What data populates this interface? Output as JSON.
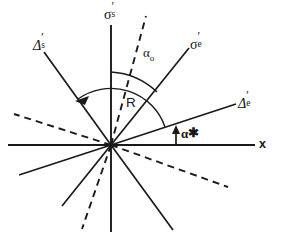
{
  "figure": {
    "type": "vector-diagram",
    "background_color": "#ffffff",
    "line_color": "#1a1a1a"
  },
  "labels": {
    "sigma_s": {
      "symbol": "σ",
      "prime": "′",
      "subscript": "s",
      "x": 104,
      "y": 5
    },
    "sigma_e": {
      "symbol": "σ",
      "prime": "′",
      "subscript": "e",
      "x": 190,
      "y": 35
    },
    "delta_s": {
      "symbol": "Δ",
      "prime": "′",
      "subscript": "s",
      "x": 33,
      "y": 36
    },
    "delta_e": {
      "symbol": "Δ",
      "prime": "′",
      "subscript": "e",
      "x": 238,
      "y": 94
    },
    "alpha_0": {
      "symbol": "α",
      "subscript": "o",
      "x": 143,
      "y": 46
    },
    "R": {
      "text": "R",
      "x": 126,
      "y": 96
    },
    "alpha_star": {
      "symbol": "α",
      "star": "✱",
      "x": 181,
      "y": 126
    },
    "x_axis": {
      "text": "x",
      "x": 259,
      "y": 138
    }
  },
  "geometry": {
    "origin": {
      "x": 111,
      "y": 145
    },
    "x_axis": {
      "x1": 8,
      "y1": 145,
      "x2": 255,
      "y2": 145
    },
    "sigma_s_axis": {
      "x1": 111,
      "y1": 25,
      "x2": 111,
      "y2": 232
    },
    "rays": [
      {
        "name": "sigma-e-ray",
        "style": "solid",
        "x1": 111,
        "y1": 145,
        "x2": 189,
        "y2": 48
      },
      {
        "name": "sigma-e-ray-opposite",
        "style": "solid",
        "x1": 111,
        "y1": 145,
        "x2": 62,
        "y2": 206
      },
      {
        "name": "delta-e-ray",
        "style": "solid",
        "x1": 111,
        "y1": 145,
        "x2": 236,
        "y2": 104
      },
      {
        "name": "delta-e-ray-opposite",
        "style": "solid",
        "x1": 111,
        "y1": 145,
        "x2": 19,
        "y2": 175
      },
      {
        "name": "delta-s-ray",
        "style": "solid",
        "x1": 111,
        "y1": 145,
        "x2": 44,
        "y2": 52
      },
      {
        "name": "delta-s-ray-opposite",
        "style": "solid",
        "x1": 111,
        "y1": 145,
        "x2": 173,
        "y2": 230
      },
      {
        "name": "dashed-bisector-ray",
        "style": "dashed",
        "x1": 111,
        "y1": 145,
        "x2": 146,
        "y2": 16
      },
      {
        "name": "dashed-bisector-ray-opposite",
        "style": "dashed",
        "x1": 111,
        "y1": 145,
        "x2": 82,
        "y2": 229
      },
      {
        "name": "dashed-transverse-ray",
        "style": "dashed",
        "x1": 111,
        "y1": 145,
        "x2": 14,
        "y2": 114
      },
      {
        "name": "dashed-transverse-ray-opposite",
        "style": "dashed",
        "x1": 111,
        "y1": 145,
        "x2": 228,
        "y2": 187
      }
    ],
    "arcs": [
      {
        "name": "alpha-0-arc",
        "from_deg": 90,
        "to_deg": 51,
        "radius": 73,
        "arrow": "none"
      },
      {
        "name": "R-arc",
        "from_deg": 18,
        "to_deg": 126,
        "radius": 57,
        "arrow": "counterclockwise-end"
      }
    ],
    "alpha_star_arrow": {
      "x": 176,
      "y_top": 128,
      "y_bottom": 145
    }
  }
}
